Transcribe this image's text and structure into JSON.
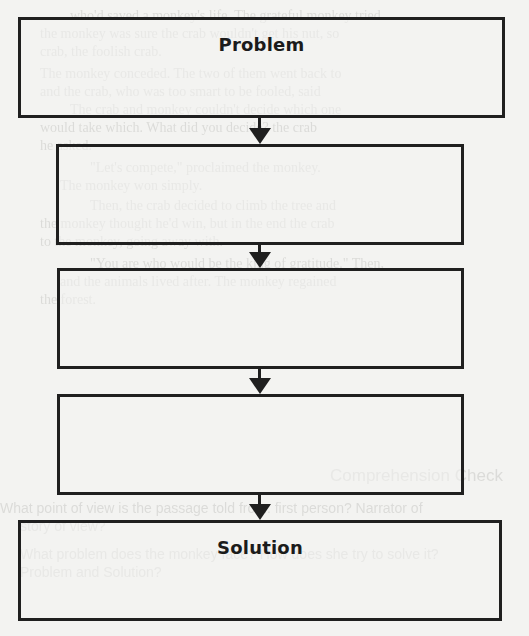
{
  "diagram": {
    "type": "vertical-flowchart",
    "colors": {
      "background": "#f3f3f1",
      "stroke": "#1f1f1f",
      "label": "#1b1b1b",
      "ghost_text": "#c9c9c6"
    },
    "boxes": [
      {
        "id": "problem",
        "label": "Problem",
        "left": 18,
        "top": 17,
        "width": 487,
        "height": 101
      },
      {
        "id": "step-1",
        "label": "",
        "left": 56,
        "top": 144,
        "width": 408,
        "height": 101
      },
      {
        "id": "step-2",
        "label": "",
        "left": 57,
        "top": 268,
        "width": 407,
        "height": 101
      },
      {
        "id": "step-3",
        "label": "",
        "left": 57,
        "top": 394,
        "width": 407,
        "height": 101
      },
      {
        "id": "solution",
        "label": "Solution",
        "left": 18,
        "top": 520,
        "width": 484,
        "height": 101
      }
    ],
    "arrows": [
      {
        "from": "problem",
        "to": "step-1"
      },
      {
        "from": "step-1",
        "to": "step-2"
      },
      {
        "from": "step-2",
        "to": "step-3"
      },
      {
        "from": "step-3",
        "to": "solution"
      }
    ]
  },
  "bleed_through": {
    "lines": [
      {
        "text": "who'd saved a monkey's life. The grateful monkey tried",
        "top": 8,
        "left": 70
      },
      {
        "text": "the monkey was sure the crab wouldn't get his nut, so",
        "top": 26,
        "left": 40
      },
      {
        "text": "crab, the foolish crab.",
        "top": 44,
        "left": 40
      },
      {
        "text": "The monkey conceded. The two of them went back to",
        "top": 66,
        "left": 40
      },
      {
        "text": "and the crab, who was too smart to be fooled, said",
        "top": 84,
        "left": 40
      },
      {
        "text": "The crab and monkey couldn't decide which one",
        "top": 102,
        "left": 70
      },
      {
        "text": "would take which. What did you decide? the crab",
        "top": 120,
        "left": 40
      },
      {
        "text": "he asked.",
        "top": 138,
        "left": 40
      },
      {
        "text": "\"Let's compete,\" proclaimed the monkey.",
        "top": 160,
        "left": 90
      },
      {
        "text": "The monkey won simply.",
        "top": 178,
        "left": 60
      },
      {
        "text": "Then, the crab decided to climb the tree and",
        "top": 198,
        "left": 90
      },
      {
        "text": "the monkey thought he'd win, but in the end the crab",
        "top": 216,
        "left": 40
      },
      {
        "text": "to the monkey, going away with.",
        "top": 234,
        "left": 40
      },
      {
        "text": "\"You are who would be the king of gratitude.\" Then,",
        "top": 256,
        "left": 90
      },
      {
        "text": "and the animals lived after. The monkey regained",
        "top": 274,
        "left": 60
      },
      {
        "text": "the forest.",
        "top": 292,
        "left": 40
      }
    ],
    "heading": {
      "text": "Comprehension Check",
      "top": 466,
      "left": 330
    },
    "questions": [
      {
        "text": "What point of view is the passage told from: first person? Narrator of",
        "top": 500,
        "left": 0
      },
      {
        "text": "story of view?",
        "top": 518,
        "left": 20
      },
      {
        "text": "What problem does the monkey face? How does she try to solve it?",
        "top": 546,
        "left": 20
      },
      {
        "text": "Problem and Solution?",
        "top": 564,
        "left": 20
      }
    ]
  }
}
